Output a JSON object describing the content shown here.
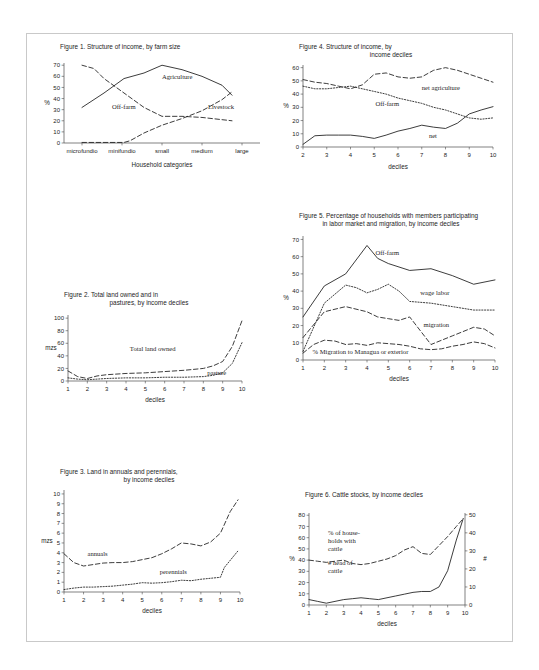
{
  "page": {
    "background": "#ffffff",
    "border_color": "#c9c9c9",
    "ink": "#1a1a1a"
  },
  "chart_data": [
    {
      "id": "figure1",
      "type": "line",
      "title": "Figure 1. Structure of income, by farm size",
      "title_lines": [
        "Figure 1. Structure of income, by farm size"
      ],
      "xlabel": "Household categories",
      "ylabel": "%",
      "categories": [
        "microfundio",
        "minifundio",
        "small",
        "medium",
        "large"
      ],
      "x": [
        1,
        2,
        3,
        4,
        5
      ],
      "xlim": [
        0.55,
        5.45
      ],
      "ylim": [
        0,
        72
      ],
      "yticks": [
        0,
        10,
        20,
        30,
        40,
        50,
        60,
        70
      ],
      "grid": false,
      "legend": "inline-labels",
      "series": [
        {
          "name": "Agriculture",
          "style": "solid",
          "label_x": 3.0,
          "label_y": 58,
          "x": [
            1.0,
            1.55,
            2.05,
            2.55,
            3.0,
            3.5,
            4.0,
            4.5,
            4.75
          ],
          "values": [
            32,
            45,
            58,
            63,
            70,
            66,
            60,
            52,
            43
          ]
        },
        {
          "name": "Off-farm",
          "style": "dashed",
          "label_x": 1.75,
          "label_y": 31,
          "x": [
            1.0,
            1.3,
            1.55,
            2.05,
            2.55,
            3.0,
            3.5,
            4.0,
            4.5,
            4.75
          ],
          "values": [
            70,
            67,
            58,
            45,
            32,
            24,
            24,
            23,
            21,
            20
          ]
        },
        {
          "name": "Livestock",
          "style": "dashed",
          "label_x": 4.15,
          "label_y": 31,
          "x": [
            1.0,
            1.55,
            2.05,
            2.2,
            2.55,
            3.0,
            3.5,
            4.0,
            4.5,
            4.75
          ],
          "values": [
            0.5,
            0.5,
            0.5,
            2,
            9,
            16,
            22,
            29,
            39,
            46
          ]
        }
      ]
    },
    {
      "id": "figure4",
      "type": "line",
      "title": "Figure 4. Structure of income, by income deciles",
      "title_lines": [
        "Figure 4. Structure of income, by",
        "income deciles"
      ],
      "xlabel": "deciles",
      "ylabel": "%",
      "x": [
        2,
        3,
        4,
        5,
        6,
        7,
        8,
        9,
        10
      ],
      "xticks": [
        2,
        3,
        4,
        5,
        6,
        7,
        8,
        9,
        10
      ],
      "xlim": [
        2,
        10
      ],
      "ylim": [
        0,
        62
      ],
      "yticks": [
        0,
        10,
        20,
        30,
        40,
        50,
        60
      ],
      "grid": false,
      "series": [
        {
          "name": "net agriculture",
          "style": "dashed",
          "label_x": 7.0,
          "label_y": 43,
          "x": [
            2,
            2.5,
            3,
            3.5,
            4,
            4.5,
            5,
            5.5,
            6,
            6.5,
            7,
            7.5,
            8,
            8.5,
            9,
            9.5,
            10
          ],
          "values": [
            51,
            49,
            48,
            46,
            44,
            47,
            55,
            56,
            53,
            52,
            53,
            58,
            60,
            58,
            55,
            52,
            49
          ]
        },
        {
          "name": "Off-farm",
          "style": "dotted",
          "label_x": 5.05,
          "label_y": 31,
          "x": [
            2,
            2.5,
            3,
            3.5,
            4,
            4.5,
            5,
            5.5,
            6,
            6.5,
            7,
            7.5,
            8,
            8.5,
            9,
            9.5,
            10
          ],
          "values": [
            46,
            44,
            44,
            45,
            46,
            44,
            42,
            40,
            37,
            35,
            33,
            30,
            28,
            25,
            22,
            21,
            22
          ]
        },
        {
          "name": "net",
          "style": "solid",
          "label_x": 7.3,
          "label_y": 7,
          "x": [
            2,
            2.5,
            3,
            3.5,
            4,
            4.5,
            5,
            5.5,
            6,
            6.5,
            7,
            7.5,
            8,
            8.5,
            9,
            9.5,
            10
          ],
          "values": [
            2,
            8.5,
            9,
            9,
            9,
            8,
            6.5,
            9,
            12,
            14,
            16.5,
            15,
            14,
            18,
            25,
            28,
            30.5
          ]
        }
      ]
    },
    {
      "id": "figure5",
      "type": "line",
      "title": "Figure 5. Percentage of households with members participating in labor market and migration, by income deciles",
      "title_lines": [
        "Figure 5. Percentage of households with members participating",
        "in labor market and migration, by income deciles"
      ],
      "xlabel": "deciles",
      "ylabel": "%",
      "x": [
        1,
        2,
        3,
        4,
        5,
        6,
        7,
        8,
        9,
        10
      ],
      "xticks": [
        1,
        2,
        3,
        4,
        5,
        6,
        7,
        8,
        9,
        10
      ],
      "xlim": [
        1,
        10
      ],
      "ylim": [
        0,
        72
      ],
      "yticks": [
        0,
        10,
        20,
        30,
        40,
        50,
        60,
        70
      ],
      "grid": false,
      "series": [
        {
          "name": "Off-farm",
          "style": "solid",
          "label_x": 4.4,
          "label_y": 61,
          "x": [
            1,
            2,
            3,
            4,
            4.5,
            5,
            6,
            7,
            8,
            9,
            10
          ],
          "values": [
            25,
            43,
            50,
            66.5,
            59,
            56,
            52,
            53,
            49,
            44,
            46.5
          ]
        },
        {
          "name": "wage labor",
          "style": "dotted",
          "label_x": 6.5,
          "label_y": 38,
          "x": [
            1,
            2,
            3,
            3.5,
            4,
            4.5,
            5,
            5.5,
            6,
            7,
            8,
            9,
            10
          ],
          "values": [
            5,
            33,
            43.5,
            42,
            39,
            41,
            44,
            40,
            34,
            33,
            31,
            29,
            29
          ]
        },
        {
          "name": "migration",
          "style": "dashed",
          "label_x": 6.65,
          "label_y": 19,
          "x": [
            1,
            2,
            3,
            4,
            4.5,
            5,
            5.5,
            6,
            6.5,
            7,
            8,
            9,
            9.5,
            10
          ],
          "values": [
            13,
            28,
            31,
            28,
            25,
            24,
            23,
            25,
            17,
            9,
            14,
            19,
            18,
            14
          ]
        },
        {
          "name": "% Migration to Managua or exterior",
          "style": "dashed",
          "label_x": 1.45,
          "label_y": 3.2,
          "x": [
            1,
            1.5,
            2,
            2.5,
            3,
            3.5,
            4,
            4.5,
            5,
            5.5,
            6,
            6.5,
            7,
            7.5,
            8,
            8.5,
            9,
            9.5,
            10
          ],
          "values": [
            4,
            9,
            11.5,
            11,
            9,
            9.5,
            8.5,
            10,
            9.5,
            9,
            8,
            6.5,
            6,
            6.5,
            8,
            9,
            10.5,
            9.5,
            7
          ]
        }
      ]
    },
    {
      "id": "figure2",
      "type": "line",
      "title": "Figure 2. Total land owned and in pastures, by income deciles",
      "title_lines": [
        "Figure 2. Total land owned and in",
        "pastures, by income deciles"
      ],
      "xlabel": "deciles",
      "ylabel": "mzs",
      "x": [
        1,
        2,
        3,
        4,
        5,
        6,
        7,
        8,
        9,
        10
      ],
      "xticks": [
        1,
        2,
        3,
        4,
        5,
        6,
        7,
        8,
        9,
        10
      ],
      "xlim": [
        1,
        10
      ],
      "ylim": [
        0,
        105
      ],
      "yticks": [
        0,
        20,
        40,
        60,
        80,
        100
      ],
      "grid": false,
      "series": [
        {
          "name": "Total land owned",
          "style": "dashed",
          "label_x": 4.2,
          "label_y": 48,
          "x": [
            1,
            1.5,
            2,
            2.5,
            3,
            4,
            5,
            6,
            7,
            8,
            8.5,
            9,
            9.5,
            10
          ],
          "values": [
            16,
            7,
            4,
            8,
            10,
            12,
            13,
            15,
            17,
            20,
            24,
            31,
            55,
            96
          ]
        },
        {
          "name": "pasture",
          "style": "dotted",
          "label_x": 8.2,
          "label_y": 9,
          "x": [
            1,
            1.5,
            2,
            2.5,
            3,
            4,
            5,
            6,
            7,
            8,
            8.5,
            9,
            9.5,
            10
          ],
          "values": [
            5,
            3,
            2,
            3,
            4,
            5,
            5,
            6,
            6,
            7,
            9,
            13,
            28,
            61
          ]
        }
      ]
    },
    {
      "id": "figure3",
      "type": "line",
      "title": "Figure 3. Land in annuals and perennials, by income deciles",
      "title_lines": [
        "Figure 3. Land in annuals and perennials,",
        "by income deciles"
      ],
      "xlabel": "deciles",
      "ylabel": "mzs",
      "x": [
        1,
        2,
        3,
        4,
        5,
        6,
        7,
        8,
        9,
        10
      ],
      "xticks": [
        1,
        2,
        3,
        4,
        5,
        6,
        7,
        8,
        9,
        10
      ],
      "xlim": [
        1,
        10
      ],
      "ylim": [
        0,
        10.4
      ],
      "yticks": [
        0,
        1,
        2,
        3,
        4,
        5,
        6,
        7,
        8,
        9,
        10
      ],
      "grid": false,
      "series": [
        {
          "name": "annuals",
          "style": "dashed",
          "label_x": 2.2,
          "label_y": 3.65,
          "x": [
            1,
            1.5,
            2,
            2.5,
            3,
            3.5,
            4,
            4.5,
            5,
            5.5,
            6,
            6.5,
            7,
            7.5,
            8,
            8.5,
            9,
            9.5,
            9.9
          ],
          "values": [
            3.9,
            3.0,
            2.65,
            2.8,
            2.95,
            3.0,
            3.0,
            3.1,
            3.3,
            3.5,
            3.9,
            4.4,
            5.0,
            4.9,
            4.7,
            5.1,
            6.0,
            8.2,
            9.4
          ]
        },
        {
          "name": "perennials",
          "style": "dotted",
          "label_x": 5.9,
          "label_y": 1.85,
          "x": [
            1,
            1.5,
            2,
            2.5,
            3,
            3.5,
            4,
            4.5,
            5,
            5.5,
            6,
            6.5,
            7,
            7.5,
            8,
            8.5,
            9,
            9.2,
            9.9
          ],
          "values": [
            0.25,
            0.4,
            0.5,
            0.5,
            0.55,
            0.6,
            0.7,
            0.8,
            0.95,
            0.9,
            0.95,
            1.05,
            1.2,
            1.15,
            1.3,
            1.4,
            1.5,
            2.5,
            4.2
          ]
        }
      ]
    },
    {
      "id": "figure6",
      "type": "line",
      "title": "Figure 6. Cattle stocks, by income deciles",
      "title_lines": [
        "Figure 6. Cattle stocks, by income deciles"
      ],
      "xlabel": "deciles",
      "ylabel": "%",
      "y2label": "#",
      "x": [
        1,
        2,
        3,
        4,
        5,
        6,
        7,
        8,
        9,
        10
      ],
      "xticks": [
        1,
        2,
        3,
        4,
        5,
        6,
        7,
        8,
        9,
        10
      ],
      "xlim": [
        1,
        10
      ],
      "ylim": [
        0,
        82
      ],
      "yticks": [
        0,
        10,
        20,
        30,
        40,
        50,
        60,
        70,
        80
      ],
      "y2lim": [
        0,
        51
      ],
      "y2ticks": [
        0,
        10,
        20,
        30,
        40,
        50
      ],
      "grid": false,
      "series": [
        {
          "name": "% of households with cattle",
          "label_lines": [
            "% of house-",
            "holds with",
            "cattle"
          ],
          "style": "dashed",
          "axis": "left",
          "label_x": 2.1,
          "label_y": 62,
          "x": [
            1,
            1.5,
            2,
            2.5,
            3,
            3.5,
            4,
            4.5,
            5,
            5.5,
            6,
            6.5,
            7,
            7.5,
            8,
            8.5,
            9,
            9.5,
            9.9
          ],
          "values": [
            40,
            39,
            38,
            39,
            40,
            37,
            36,
            37,
            39,
            41,
            44,
            49,
            52,
            46,
            45,
            53,
            61,
            70,
            77
          ]
        },
        {
          "name": "# head of cattle",
          "label_lines": [
            "# head of",
            "cattle"
          ],
          "style": "solid",
          "axis": "right",
          "label_x": 2.1,
          "label_y": 22,
          "x": [
            1,
            1.5,
            2,
            2.5,
            3,
            3.5,
            4,
            4.5,
            5,
            5.5,
            6,
            6.5,
            7,
            7.5,
            8,
            8.5,
            9,
            9.5,
            9.9
          ],
          "values": [
            3,
            2,
            1,
            2,
            3,
            3.5,
            4,
            3.5,
            3,
            4,
            5,
            6,
            7,
            7.5,
            7.5,
            10,
            19,
            36,
            48
          ]
        }
      ]
    }
  ]
}
